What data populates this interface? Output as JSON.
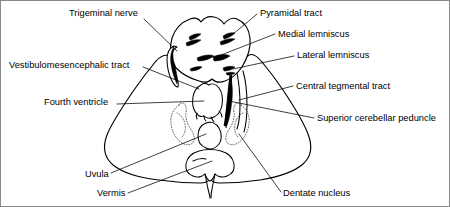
{
  "figure": {
    "background_color": "#ffffff",
    "line_color": "#000000",
    "border_color": "#8a8a8a",
    "labels": [
      {
        "id": "trigeminal-nerve",
        "text": "Trigeminal nerve",
        "side": "left",
        "x": 68,
        "y": 8,
        "align": "left"
      },
      {
        "id": "vestibulomesencephalic-tract",
        "text": "Vestibulomesencephalic tract",
        "side": "left",
        "x": 8,
        "y": 60,
        "align": "left"
      },
      {
        "id": "fourth-ventricle",
        "text": "Fourth ventricle",
        "side": "left",
        "x": 43,
        "y": 97,
        "align": "left"
      },
      {
        "id": "uvula",
        "text": "Uvula",
        "side": "left",
        "x": 84,
        "y": 169,
        "align": "left"
      },
      {
        "id": "vermis",
        "text": "Vermis",
        "side": "left",
        "x": 96,
        "y": 188,
        "align": "left"
      },
      {
        "id": "pyramidal-tract",
        "text": "Pyramidal tract",
        "side": "right",
        "x": 259,
        "y": 8,
        "align": "left"
      },
      {
        "id": "medial-lemniscus",
        "text": "Medial lemniscus",
        "side": "right",
        "x": 277,
        "y": 29,
        "align": "left"
      },
      {
        "id": "lateral-lemniscus",
        "text": "Lateral lemniscus",
        "side": "right",
        "x": 296,
        "y": 50,
        "align": "left"
      },
      {
        "id": "central-tegmental-tract",
        "text": "Central tegmental tract",
        "side": "right",
        "x": 295,
        "y": 81,
        "align": "left"
      },
      {
        "id": "superior-cerebellar-peduncle",
        "text": "Superior cerebellar peduncle",
        "side": "right",
        "x": 316,
        "y": 113,
        "align": "left"
      },
      {
        "id": "dentate-nucleus",
        "text": "Dentate nucleus",
        "side": "right",
        "x": 282,
        "y": 188,
        "align": "left"
      }
    ],
    "structures": [
      {
        "id": "cerebellum-outline",
        "name": "cerebellum and pons outline"
      },
      {
        "id": "pons-outline",
        "name": "pons"
      },
      {
        "id": "fourth-ventricle-shape",
        "name": "fourth ventricle"
      },
      {
        "id": "vermis-shape",
        "name": "vermis"
      },
      {
        "id": "uvula-shape",
        "name": "uvula"
      },
      {
        "id": "dentate-nucleus-left",
        "name": "dentate nucleus left"
      },
      {
        "id": "dentate-nucleus-right",
        "name": "dentate nucleus right"
      },
      {
        "id": "pyramidal-tract-mark",
        "name": "pyramidal tract marking"
      },
      {
        "id": "medial-lemniscus-mark",
        "name": "medial lemniscus marking"
      },
      {
        "id": "lateral-lemniscus-mark",
        "name": "lateral lemniscus marking"
      },
      {
        "id": "trigeminal-nerve-mark",
        "name": "trigeminal nerve root"
      },
      {
        "id": "superior-cerebellar-peduncle-mark",
        "name": "superior cerebellar peduncle"
      },
      {
        "id": "central-tegmental-tract-mark",
        "name": "central tegmental tract"
      }
    ]
  }
}
